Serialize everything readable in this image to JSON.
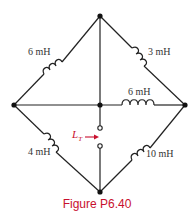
{
  "figure": {
    "caption": "Figure P6.40",
    "type": "circuit",
    "accent_color": "#c8102e",
    "wire_color": "#222222"
  },
  "components": {
    "upper_left": {
      "label": "6 mH",
      "type": "inductor"
    },
    "upper_right": {
      "label": "3 mH",
      "type": "inductor"
    },
    "center_right": {
      "label": "6 mH",
      "type": "inductor"
    },
    "lower_left": {
      "label": "4 mH",
      "type": "inductor"
    },
    "lower_right": {
      "label": "10 mH",
      "type": "inductor"
    }
  },
  "terminal": {
    "label_main": "L",
    "label_sub": "T",
    "arrow": "right-arrow-icon"
  }
}
